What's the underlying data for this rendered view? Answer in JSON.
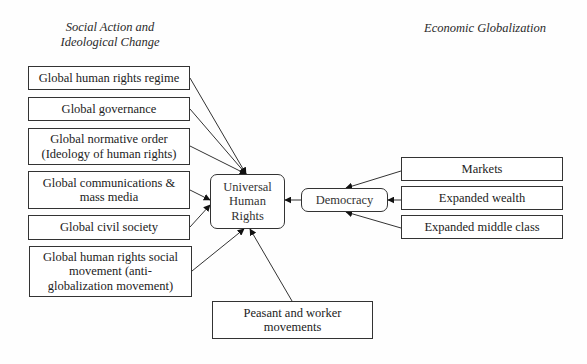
{
  "headings": {
    "left": "Social Action and\nIdeological Change",
    "right": "Economic Globalization"
  },
  "left_nodes": [
    {
      "id": "global-human-rights-regime",
      "label": "Global human rights regime"
    },
    {
      "id": "global-governance",
      "label": "Global governance"
    },
    {
      "id": "global-normative-order",
      "label": "Global normative order\n(Ideology of human rights)"
    },
    {
      "id": "global-communications",
      "label": "Global communications &\nmass media"
    },
    {
      "id": "global-civil-society",
      "label": "Global civil society"
    },
    {
      "id": "global-human-rights-social-movement",
      "label": "Global human rights social\nmovement (anti-\nglobalization movement)"
    }
  ],
  "center_node": {
    "id": "universal-human-rights",
    "label": "Universal\nHuman\nRights"
  },
  "democracy_node": {
    "id": "democracy",
    "label": "Democracy"
  },
  "right_nodes": [
    {
      "id": "markets",
      "label": "Markets"
    },
    {
      "id": "expanded-wealth",
      "label": "Expanded wealth"
    },
    {
      "id": "expanded-middle-class",
      "label": "Expanded middle class"
    }
  ],
  "bottom_node": {
    "id": "peasant-worker-movements",
    "label": "Peasant and worker\nmovements"
  },
  "edges": [
    {
      "from": "global-human-rights-regime",
      "to": "universal-human-rights"
    },
    {
      "from": "global-governance",
      "to": "universal-human-rights"
    },
    {
      "from": "global-normative-order",
      "to": "universal-human-rights"
    },
    {
      "from": "global-communications",
      "to": "universal-human-rights"
    },
    {
      "from": "global-civil-society",
      "to": "universal-human-rights"
    },
    {
      "from": "global-human-rights-social-movement",
      "to": "universal-human-rights"
    },
    {
      "from": "peasant-worker-movements",
      "to": "universal-human-rights"
    },
    {
      "from": "democracy",
      "to": "universal-human-rights"
    },
    {
      "from": "markets",
      "to": "democracy"
    },
    {
      "from": "expanded-wealth",
      "to": "democracy"
    },
    {
      "from": "expanded-middle-class",
      "to": "democracy"
    }
  ]
}
